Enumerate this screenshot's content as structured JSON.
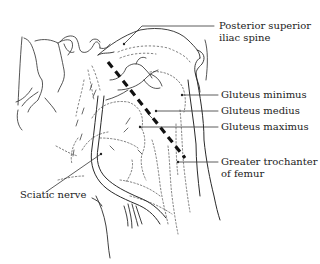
{
  "figure": {
    "type": "anatomical line drawing",
    "line_color": "#222222",
    "background_color": "#ffffff"
  },
  "labels": {
    "posterior_superior_iliac_spine": {
      "line1": "Posterior superior",
      "line2": "iliac spine"
    },
    "gluteus_minimus": "Gluteus minimus",
    "gluteus_medius": "Gluteus medius",
    "gluteus_maximus": "Gluteus maximus",
    "greater_trochanter": {
      "line1": "Greater trochanter",
      "line2": "of femur"
    },
    "sciatic_nerve": "Sciatic nerve"
  },
  "landmark_line": {
    "style": "dashed",
    "from": "Posterior superior iliac spine",
    "to": "Greater trochanter of femur"
  }
}
